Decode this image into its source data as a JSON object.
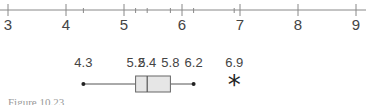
{
  "chart_data": {
    "type": "boxplot",
    "title": "",
    "xlabel": "",
    "axis": {
      "min": 3,
      "max": 9,
      "major_ticks": [
        3,
        4,
        5,
        6,
        7,
        8,
        9
      ],
      "tick_labels": [
        "3",
        "4",
        "5",
        "6",
        "7",
        "8",
        "9"
      ],
      "minor_marks": [
        4.3,
        5.2,
        5.4,
        5.8,
        6.2,
        6.9
      ]
    },
    "box": {
      "min": 4.3,
      "q1": 5.2,
      "median": 5.4,
      "q3": 5.8,
      "max": 6.2,
      "outliers": [
        6.9
      ]
    },
    "value_labels": [
      "4.3",
      "5.2",
      "5.4",
      "5.8",
      "6.2",
      "6.9"
    ],
    "outlier_symbol": "*",
    "colors": {
      "axis": "#888888",
      "box_fill": "#e6e6e6",
      "box_stroke": "#666666",
      "text": "#444444"
    }
  },
  "caption": "Figure 10.23"
}
